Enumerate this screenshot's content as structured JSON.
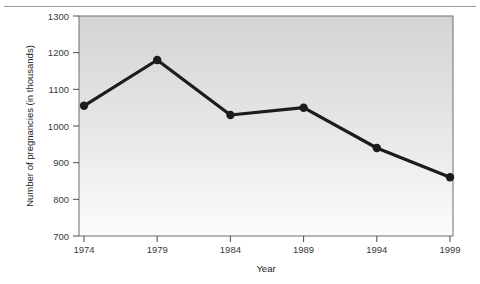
{
  "chart_data": {
    "type": "line",
    "title": "",
    "xlabel": "Year",
    "ylabel": "Number of pregnancies (in thousands)",
    "categories": [
      1974,
      1979,
      1984,
      1989,
      1994,
      1999
    ],
    "xtick_labels": [
      "1974",
      "1979",
      "1984",
      "1989",
      "1994",
      "1999"
    ],
    "values": [
      1055,
      1180,
      1030,
      1050,
      940,
      860
    ],
    "ytick_labels": [
      "1300",
      "1200",
      "1100",
      "1000",
      "900",
      "800",
      "700"
    ],
    "yticks": [
      1300,
      1200,
      1100,
      1000,
      900,
      800,
      700
    ],
    "ylim": [
      700,
      1300
    ],
    "xlim": [
      1974,
      1999
    ],
    "grid": false,
    "legend": "none",
    "series": [
      {
        "name": "Number of pregnancies (in thousands)",
        "values": [
          1055,
          1180,
          1030,
          1050,
          940,
          860
        ],
        "marker": "circle",
        "line_color": "#1c1c1c",
        "marker_color": "#1c1c1c"
      }
    ],
    "plot_bg_gradient_top": "#d6d6d6",
    "plot_bg_gradient_bottom": "#fbfbfb",
    "axis_color": "#4a4a4a"
  }
}
